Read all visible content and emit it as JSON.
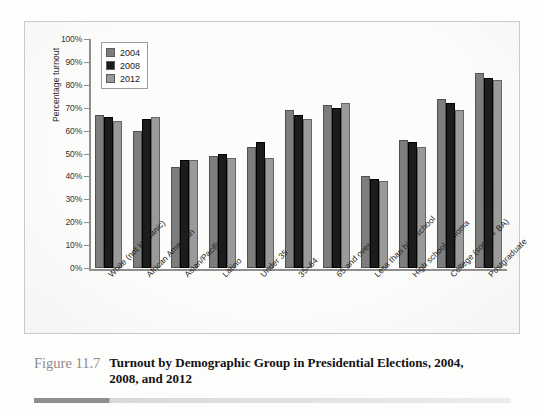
{
  "figure": {
    "number": "Figure 11.7",
    "title": "Turnout by Demographic Group in Presidential Elections, 2004, 2008, and 2012"
  },
  "legend": {
    "items": [
      {
        "label": "2004",
        "color": "#7d7d7d"
      },
      {
        "label": "2008",
        "color": "#1c1c1c"
      },
      {
        "label": "2012",
        "color": "#9a9a9a"
      }
    ]
  },
  "axes": {
    "y_title": "Percentage turnout",
    "y_ticks": [
      "100%",
      "90%",
      "80%",
      "70%",
      "60%",
      "50%",
      "40%",
      "30%",
      "20%",
      "10%",
      "0%"
    ]
  },
  "chart_data": {
    "type": "bar",
    "title": "Turnout by Demographic Group in Presidential Elections, 2004, 2008, and 2012",
    "xlabel": "",
    "ylabel": "Percentage turnout",
    "ylim": [
      0,
      100
    ],
    "ytick_step": 10,
    "grid": false,
    "legend_position": "top-left-inside",
    "categories": [
      "White (not Hispanic)",
      "African American",
      "Asian/Pacific",
      "Latino",
      "Under 35",
      "35–64",
      "65 and over",
      "Less than high school",
      "High school diploma",
      "College (some + BA)",
      "Postgraduate"
    ],
    "series": [
      {
        "name": "2004",
        "color": "#7d7d7d",
        "values": [
          67,
          60,
          44,
          49,
          53,
          69,
          71,
          40,
          56,
          74,
          85
        ]
      },
      {
        "name": "2008",
        "color": "#1c1c1c",
        "values": [
          66,
          65,
          47,
          50,
          55,
          67,
          70,
          39,
          55,
          72,
          83
        ]
      },
      {
        "name": "2012",
        "color": "#9a9a9a",
        "values": [
          64,
          66,
          47,
          48,
          48,
          65,
          72,
          38,
          53,
          69,
          82
        ]
      }
    ]
  }
}
